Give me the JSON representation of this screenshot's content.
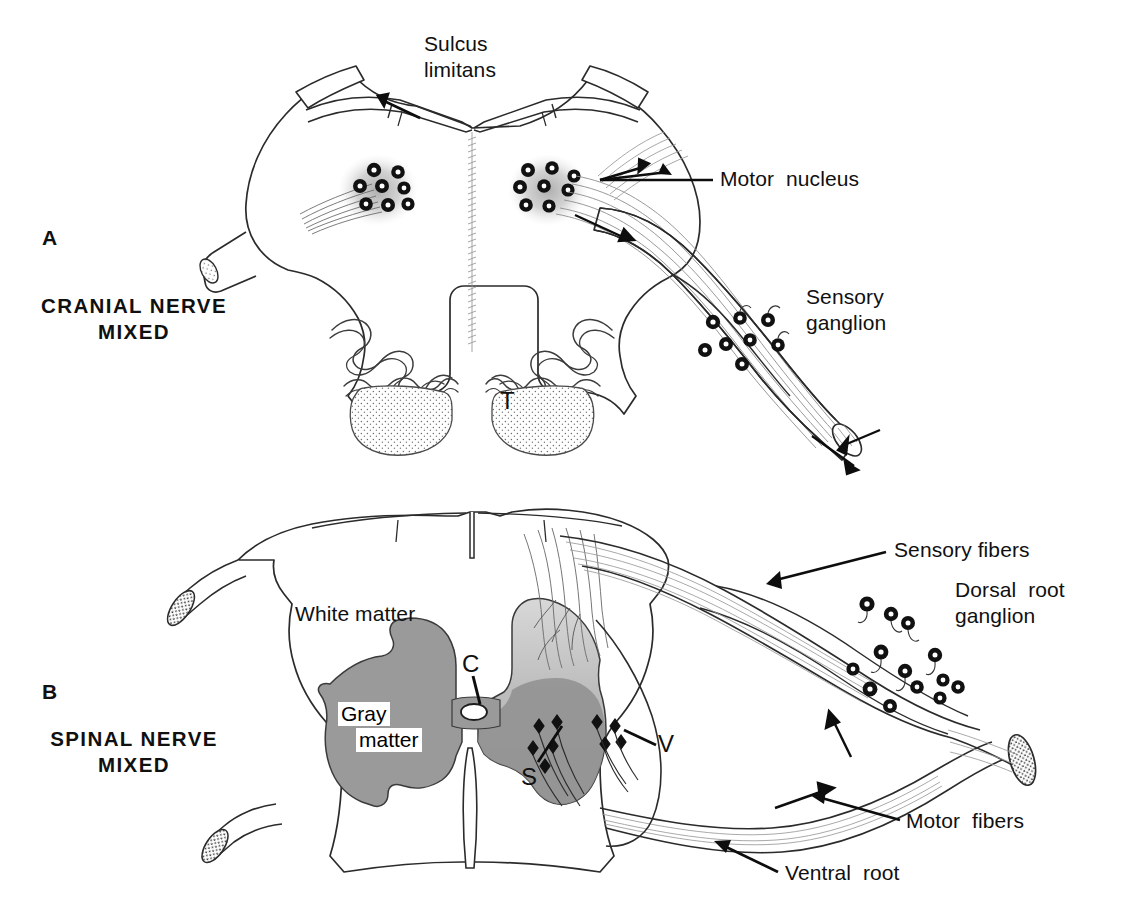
{
  "figure": {
    "background_color": "#ffffff",
    "ink_color": "#101010",
    "gray_matter_color": "#9a9a9a",
    "dorsal_horn_color": "#bcbcbc",
    "nucleus_halo_color": "#c9c9c9"
  },
  "panels": [
    {
      "letter": "A",
      "caption_line1": "CRANIAL NERVE",
      "caption_line2": "MIXED",
      "structure_label": "T"
    },
    {
      "letter": "B",
      "caption_line1": "SPINAL NERVE",
      "caption_line2": "MIXED",
      "white_matter_label": "White matter",
      "gray_matter_label_line1": "Gray",
      "gray_matter_label_line2": "matter",
      "canal_label": "C",
      "sensory_label": "S",
      "ventral_label": "V"
    }
  ],
  "callouts": [
    {
      "id": "sulcus-limitans",
      "line1": "Sulcus",
      "line2": "limitans"
    },
    {
      "id": "motor-nucleus",
      "text": "Motor  nucleus"
    },
    {
      "id": "sensory-ganglion",
      "line1": "Sensory",
      "line2": "ganglion"
    },
    {
      "id": "sensory-fibers",
      "text": "Sensory fibers"
    },
    {
      "id": "dorsal-root-ganglion",
      "line1": "Dorsal  root",
      "line2": "ganglion"
    },
    {
      "id": "motor-fibers",
      "text": "Motor  fibers"
    },
    {
      "id": "ventral-root",
      "text": "Ventral  root"
    }
  ]
}
